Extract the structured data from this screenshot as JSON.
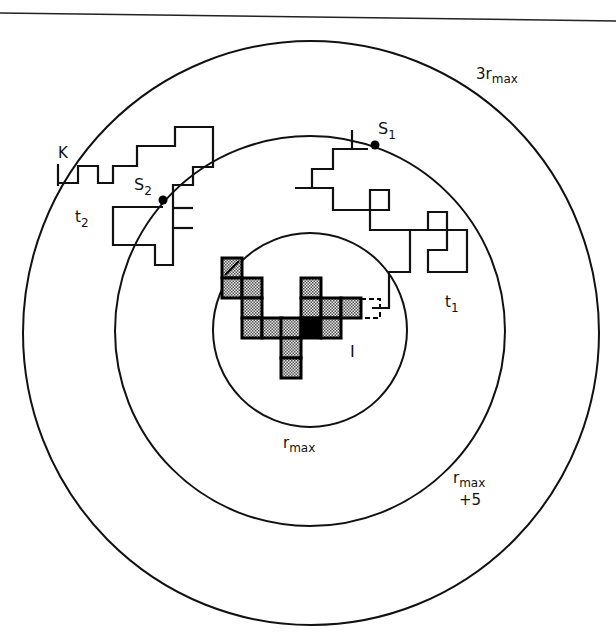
{
  "diagram": {
    "type": "aggregation-radii-schematic",
    "colors": {
      "line": "#111111",
      "cell_fill": "#bdbdbd",
      "seed_cell": "#000000",
      "background": "#ffffff"
    },
    "circles": [
      {
        "id": "inner",
        "label": "r",
        "label_sub": "max"
      },
      {
        "id": "middle",
        "label": "r",
        "label_sub": "max",
        "label_line2": "+5"
      },
      {
        "id": "outer",
        "label": "3r",
        "label_sub": "max"
      }
    ],
    "points": {
      "K": {
        "label": "K"
      },
      "S1": {
        "label": "S",
        "sub": "1"
      },
      "S2": {
        "label": "S",
        "sub": "2"
      }
    },
    "walks": {
      "t1": {
        "label": "t",
        "sub": "1"
      },
      "t2": {
        "label": "t",
        "sub": "2"
      }
    },
    "cluster": {
      "label": "I",
      "cell_count": 16,
      "seed_cells": 1,
      "dashed_cells": 1
    }
  }
}
